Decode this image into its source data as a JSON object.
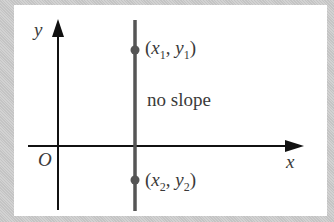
{
  "diagram": {
    "axes": {
      "x_label": "x",
      "y_label": "y",
      "origin_label": "O"
    },
    "vertical_line": {
      "caption": "no slope"
    },
    "points": [
      {
        "name": "point-1",
        "x_var": "x",
        "x_sub": "1",
        "y_var": "y",
        "y_sub": "1"
      },
      {
        "name": "point-2",
        "x_var": "x",
        "x_sub": "2",
        "y_var": "y",
        "y_sub": "2"
      }
    ],
    "punct": {
      "open": "(",
      "comma": ", ",
      "close": ")"
    },
    "colors": {
      "axis": "#111111",
      "line": "#555555",
      "point": "#555555",
      "text": "#3a3a3a",
      "frame": "#c9c9c9",
      "panel": "#ffffff"
    }
  }
}
